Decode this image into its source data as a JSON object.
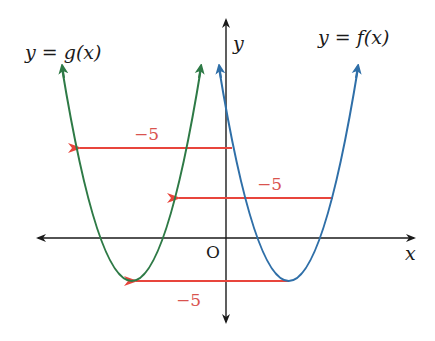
{
  "diagram": {
    "labels": {
      "g_curve": "y = g(x)",
      "f_curve": "y = f(x)",
      "x_axis": "x",
      "y_axis": "y",
      "origin": "O",
      "shift_top": "−5",
      "shift_middle": "−5",
      "shift_bottom": "−5"
    },
    "colors": {
      "f_curve": "#2f6fa8",
      "g_curve": "#2e7a46",
      "shift_arrows": "#e8453c",
      "shift_labels": "#d9534f",
      "axes": "#1a1a1a"
    },
    "geometry": {
      "origin_px": [
        226,
        238
      ],
      "f_vertex_px": [
        289,
        281
      ],
      "g_vertex_px": [
        132,
        281
      ],
      "shift_px": -157
    }
  }
}
